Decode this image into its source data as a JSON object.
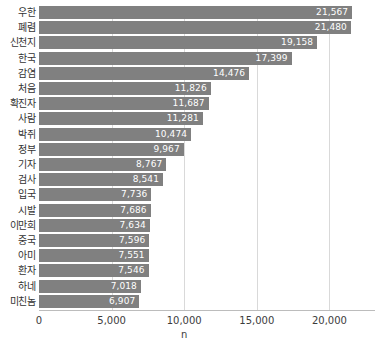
{
  "chart_data": {
    "type": "bar",
    "orientation": "horizontal",
    "title": "",
    "xlabel": "n",
    "ylabel": "",
    "xlim": [
      0,
      23000
    ],
    "grid": "vertical",
    "legend": "none",
    "bar_color": "#808080",
    "value_label_color": "#ffffff",
    "gridline_color": "#d9d9d9",
    "axis_color": "#bcbcbc",
    "categories": [
      "우한",
      "폐렴",
      "신천지",
      "한국",
      "감염",
      "처음",
      "확진자",
      "사람",
      "박쥐",
      "정부",
      "기자",
      "검사",
      "입국",
      "시발",
      "이만희",
      "중국",
      "아미",
      "환자",
      "하네",
      "미친놈"
    ],
    "values": [
      21567,
      21480,
      19158,
      17399,
      14476,
      11826,
      11687,
      11281,
      10474,
      9967,
      8767,
      8541,
      7736,
      7686,
      7634,
      7596,
      7551,
      7546,
      7018,
      6907
    ],
    "value_labels": [
      "21,567",
      "21,480",
      "19,158",
      "17,399",
      "14,476",
      "11,826",
      "11,687",
      "11,281",
      "10,474",
      "9,967",
      "8,767",
      "8,541",
      "7,736",
      "7,686",
      "7,634",
      "7,596",
      "7,551",
      "7,546",
      "7,018",
      "6,907"
    ],
    "xticks": [
      0,
      5000,
      10000,
      15000,
      20000
    ],
    "xtick_labels": [
      "0",
      "5,000",
      "10,000",
      "15,000",
      "20,000"
    ]
  }
}
